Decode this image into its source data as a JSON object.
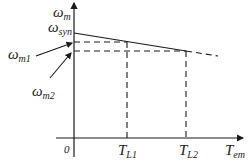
{
  "diagram": {
    "type": "mechanical-characteristic",
    "axes": {
      "y_label": "ω",
      "y_label_sub": "m",
      "x_label": "T",
      "x_label_sub": "em",
      "origin_label": "0"
    },
    "labels": {
      "w_syn": "ω",
      "w_syn_sub": "syn",
      "w_m1": "ω",
      "w_m1_sub": "m1",
      "w_m2": "ω",
      "w_m2_sub": "m2",
      "T_L1": "T",
      "T_L1_sub": "L1",
      "T_L2": "T",
      "T_L2_sub": "L2"
    },
    "colors": {
      "stroke": "#1a1a1a",
      "background": "#ffffff"
    }
  }
}
